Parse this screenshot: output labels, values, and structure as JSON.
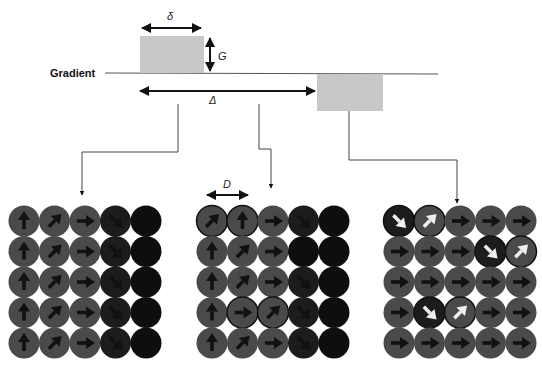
{
  "diagram": {
    "gradient_label": "Gradient",
    "delta_small_label": "δ",
    "G_label": "G",
    "Delta_label": "Δ",
    "D_label": "D",
    "colors": {
      "pulse": "#c8c8c8",
      "line": "#333333",
      "spin_gray": "#4a4a4a",
      "spin_dark": "#1c1c1c",
      "spin_black": "#0e0e0e",
      "arrow_black": "#111111",
      "arrow_white": "#eeeeee"
    },
    "panels": [
      {
        "name": "after-first-pulse",
        "rows": [
          [
            "up",
            "ne",
            "e",
            "se-dark",
            "black"
          ],
          [
            "up",
            "ne",
            "e",
            "se-dark",
            "black"
          ],
          [
            "up",
            "ne",
            "e",
            "se-dark",
            "black"
          ],
          [
            "up",
            "ne",
            "e",
            "se-dark",
            "black"
          ],
          [
            "up",
            "ne",
            "e",
            "se-dark",
            "black"
          ]
        ]
      },
      {
        "name": "during-diffusion",
        "rows": [
          [
            "ne-ring",
            "up-ring",
            "e",
            "se-dark",
            "black"
          ],
          [
            "up",
            "ne",
            "e",
            "black",
            "black"
          ],
          [
            "up",
            "ne",
            "e",
            "se-dark",
            "black"
          ],
          [
            "up",
            "e-ring",
            "ne-ring",
            "se-dark",
            "black"
          ],
          [
            "up",
            "ne",
            "e",
            "se-dark",
            "black"
          ]
        ]
      },
      {
        "name": "after-second-pulse",
        "rows": [
          [
            "se-white-dark",
            "ne-white",
            "e",
            "e",
            "e"
          ],
          [
            "e",
            "e",
            "e",
            "se-white-dark",
            "ne-white"
          ],
          [
            "e",
            "e",
            "e",
            "e",
            "e"
          ],
          [
            "e",
            "se-white-dark",
            "ne-white",
            "e",
            "e"
          ],
          [
            "e",
            "e",
            "e",
            "e",
            "e"
          ]
        ]
      }
    ]
  }
}
